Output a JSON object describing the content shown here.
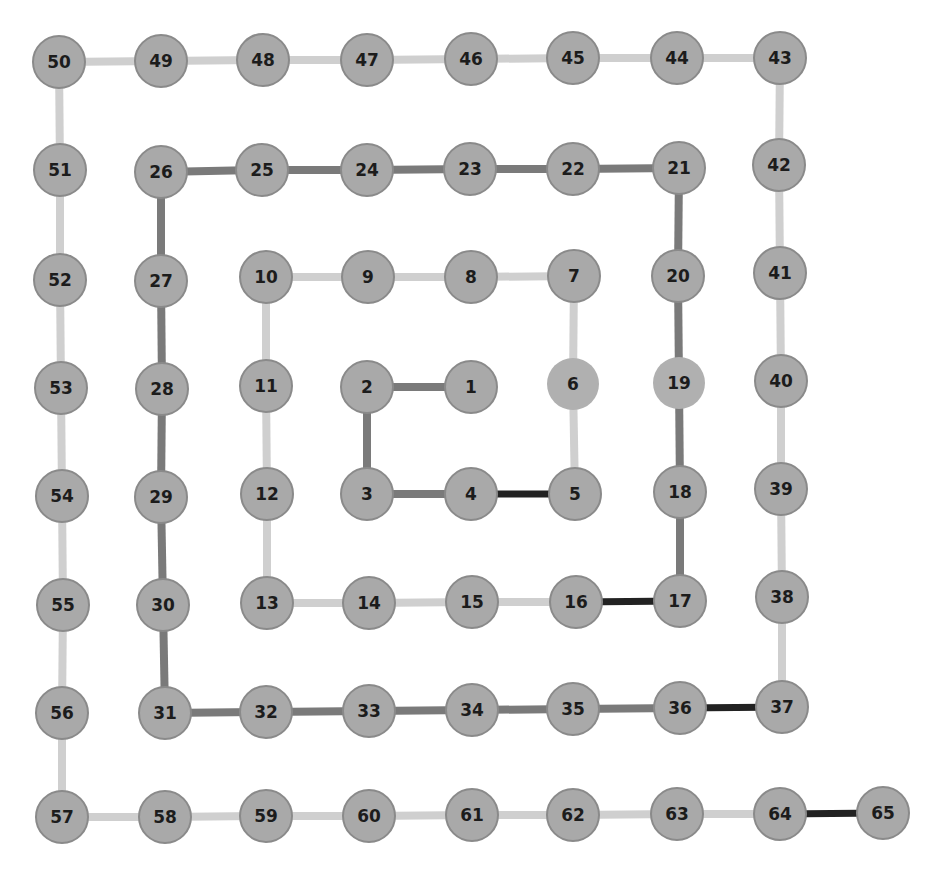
{
  "diagram": {
    "type": "spiral-path-graph",
    "node_radius": 26,
    "colors": {
      "background": "#ffffff",
      "node_fill": "#a9a9a9",
      "node_fill_plain": "#b0b0b0",
      "node_stroke": "#8a8a8a",
      "label": "#1c1c1c",
      "edge_light": "#cfcfcf",
      "edge_dark": "#7a7a7a",
      "edge_black": "#222222"
    },
    "nodes": [
      {
        "id": "1",
        "x": 471,
        "y": 387
      },
      {
        "id": "2",
        "x": 367,
        "y": 387
      },
      {
        "id": "3",
        "x": 367,
        "y": 494
      },
      {
        "id": "4",
        "x": 471,
        "y": 494
      },
      {
        "id": "5",
        "x": 575,
        "y": 494
      },
      {
        "id": "6",
        "x": 573,
        "y": 384,
        "plain": true
      },
      {
        "id": "7",
        "x": 574,
        "y": 276
      },
      {
        "id": "8",
        "x": 471,
        "y": 277
      },
      {
        "id": "9",
        "x": 368,
        "y": 277
      },
      {
        "id": "10",
        "x": 266,
        "y": 277
      },
      {
        "id": "11",
        "x": 266,
        "y": 386
      },
      {
        "id": "12",
        "x": 267,
        "y": 494
      },
      {
        "id": "13",
        "x": 267,
        "y": 603
      },
      {
        "id": "14",
        "x": 369,
        "y": 603
      },
      {
        "id": "15",
        "x": 472,
        "y": 602
      },
      {
        "id": "16",
        "x": 576,
        "y": 602
      },
      {
        "id": "17",
        "x": 680,
        "y": 601
      },
      {
        "id": "18",
        "x": 680,
        "y": 492
      },
      {
        "id": "19",
        "x": 679,
        "y": 383,
        "plain": true
      },
      {
        "id": "20",
        "x": 678,
        "y": 276
      },
      {
        "id": "21",
        "x": 679,
        "y": 168
      },
      {
        "id": "22",
        "x": 573,
        "y": 169
      },
      {
        "id": "23",
        "x": 470,
        "y": 169
      },
      {
        "id": "24",
        "x": 367,
        "y": 170
      },
      {
        "id": "25",
        "x": 262,
        "y": 170
      },
      {
        "id": "26",
        "x": 161,
        "y": 172
      },
      {
        "id": "27",
        "x": 161,
        "y": 281
      },
      {
        "id": "28",
        "x": 162,
        "y": 389
      },
      {
        "id": "29",
        "x": 161,
        "y": 497
      },
      {
        "id": "30",
        "x": 163,
        "y": 605
      },
      {
        "id": "31",
        "x": 165,
        "y": 713
      },
      {
        "id": "32",
        "x": 266,
        "y": 712
      },
      {
        "id": "33",
        "x": 369,
        "y": 711
      },
      {
        "id": "34",
        "x": 472,
        "y": 710
      },
      {
        "id": "35",
        "x": 573,
        "y": 709
      },
      {
        "id": "36",
        "x": 680,
        "y": 708
      },
      {
        "id": "37",
        "x": 782,
        "y": 707
      },
      {
        "id": "38",
        "x": 782,
        "y": 597
      },
      {
        "id": "39",
        "x": 781,
        "y": 489
      },
      {
        "id": "40",
        "x": 781,
        "y": 381
      },
      {
        "id": "41",
        "x": 780,
        "y": 273
      },
      {
        "id": "42",
        "x": 779,
        "y": 165
      },
      {
        "id": "43",
        "x": 780,
        "y": 58
      },
      {
        "id": "44",
        "x": 677,
        "y": 58
      },
      {
        "id": "45",
        "x": 573,
        "y": 58
      },
      {
        "id": "46",
        "x": 471,
        "y": 59
      },
      {
        "id": "47",
        "x": 367,
        "y": 60
      },
      {
        "id": "48",
        "x": 263,
        "y": 60
      },
      {
        "id": "49",
        "x": 161,
        "y": 61
      },
      {
        "id": "50",
        "x": 59,
        "y": 62
      },
      {
        "id": "51",
        "x": 60,
        "y": 170
      },
      {
        "id": "52",
        "x": 60,
        "y": 280
      },
      {
        "id": "53",
        "x": 61,
        "y": 388
      },
      {
        "id": "54",
        "x": 62,
        "y": 496
      },
      {
        "id": "55",
        "x": 63,
        "y": 605
      },
      {
        "id": "56",
        "x": 62,
        "y": 713
      },
      {
        "id": "57",
        "x": 62,
        "y": 817
      },
      {
        "id": "58",
        "x": 165,
        "y": 817
      },
      {
        "id": "59",
        "x": 266,
        "y": 816
      },
      {
        "id": "60",
        "x": 369,
        "y": 816
      },
      {
        "id": "61",
        "x": 472,
        "y": 815
      },
      {
        "id": "62",
        "x": 573,
        "y": 815
      },
      {
        "id": "63",
        "x": 677,
        "y": 814
      },
      {
        "id": "64",
        "x": 780,
        "y": 814
      },
      {
        "id": "65",
        "x": 883,
        "y": 813
      }
    ],
    "edges": [
      {
        "from": "1",
        "to": "2",
        "weight": "dark"
      },
      {
        "from": "2",
        "to": "3",
        "weight": "dark"
      },
      {
        "from": "3",
        "to": "4",
        "weight": "dark"
      },
      {
        "from": "4",
        "to": "5",
        "weight": "black"
      },
      {
        "from": "5",
        "to": "6",
        "weight": "light"
      },
      {
        "from": "6",
        "to": "7",
        "weight": "light"
      },
      {
        "from": "7",
        "to": "8",
        "weight": "light"
      },
      {
        "from": "8",
        "to": "9",
        "weight": "light"
      },
      {
        "from": "9",
        "to": "10",
        "weight": "light"
      },
      {
        "from": "10",
        "to": "11",
        "weight": "light"
      },
      {
        "from": "11",
        "to": "12",
        "weight": "light"
      },
      {
        "from": "12",
        "to": "13",
        "weight": "light"
      },
      {
        "from": "13",
        "to": "14",
        "weight": "light"
      },
      {
        "from": "14",
        "to": "15",
        "weight": "light"
      },
      {
        "from": "15",
        "to": "16",
        "weight": "light"
      },
      {
        "from": "16",
        "to": "17",
        "weight": "black"
      },
      {
        "from": "17",
        "to": "18",
        "weight": "dark"
      },
      {
        "from": "18",
        "to": "19",
        "weight": "dark"
      },
      {
        "from": "19",
        "to": "20",
        "weight": "dark"
      },
      {
        "from": "20",
        "to": "21",
        "weight": "dark"
      },
      {
        "from": "21",
        "to": "22",
        "weight": "dark"
      },
      {
        "from": "22",
        "to": "23",
        "weight": "dark"
      },
      {
        "from": "23",
        "to": "24",
        "weight": "dark"
      },
      {
        "from": "24",
        "to": "25",
        "weight": "dark"
      },
      {
        "from": "25",
        "to": "26",
        "weight": "dark"
      },
      {
        "from": "26",
        "to": "27",
        "weight": "dark"
      },
      {
        "from": "27",
        "to": "28",
        "weight": "dark"
      },
      {
        "from": "28",
        "to": "29",
        "weight": "dark"
      },
      {
        "from": "29",
        "to": "30",
        "weight": "dark"
      },
      {
        "from": "30",
        "to": "31",
        "weight": "dark"
      },
      {
        "from": "31",
        "to": "32",
        "weight": "dark"
      },
      {
        "from": "32",
        "to": "33",
        "weight": "dark"
      },
      {
        "from": "33",
        "to": "34",
        "weight": "dark"
      },
      {
        "from": "34",
        "to": "35",
        "weight": "dark"
      },
      {
        "from": "35",
        "to": "36",
        "weight": "dark"
      },
      {
        "from": "36",
        "to": "37",
        "weight": "black"
      },
      {
        "from": "37",
        "to": "38",
        "weight": "light"
      },
      {
        "from": "38",
        "to": "39",
        "weight": "light"
      },
      {
        "from": "39",
        "to": "40",
        "weight": "light"
      },
      {
        "from": "40",
        "to": "41",
        "weight": "light"
      },
      {
        "from": "41",
        "to": "42",
        "weight": "light"
      },
      {
        "from": "42",
        "to": "43",
        "weight": "light"
      },
      {
        "from": "43",
        "to": "44",
        "weight": "light"
      },
      {
        "from": "44",
        "to": "45",
        "weight": "light"
      },
      {
        "from": "45",
        "to": "46",
        "weight": "light"
      },
      {
        "from": "46",
        "to": "47",
        "weight": "light"
      },
      {
        "from": "47",
        "to": "48",
        "weight": "light"
      },
      {
        "from": "48",
        "to": "49",
        "weight": "light"
      },
      {
        "from": "49",
        "to": "50",
        "weight": "light"
      },
      {
        "from": "50",
        "to": "51",
        "weight": "light"
      },
      {
        "from": "51",
        "to": "52",
        "weight": "light"
      },
      {
        "from": "52",
        "to": "53",
        "weight": "light"
      },
      {
        "from": "53",
        "to": "54",
        "weight": "light"
      },
      {
        "from": "54",
        "to": "55",
        "weight": "light"
      },
      {
        "from": "55",
        "to": "56",
        "weight": "light"
      },
      {
        "from": "56",
        "to": "57",
        "weight": "light"
      },
      {
        "from": "57",
        "to": "58",
        "weight": "light"
      },
      {
        "from": "58",
        "to": "59",
        "weight": "light"
      },
      {
        "from": "59",
        "to": "60",
        "weight": "light"
      },
      {
        "from": "60",
        "to": "61",
        "weight": "light"
      },
      {
        "from": "61",
        "to": "62",
        "weight": "light"
      },
      {
        "from": "62",
        "to": "63",
        "weight": "light"
      },
      {
        "from": "63",
        "to": "64",
        "weight": "light"
      },
      {
        "from": "64",
        "to": "65",
        "weight": "black"
      }
    ]
  }
}
